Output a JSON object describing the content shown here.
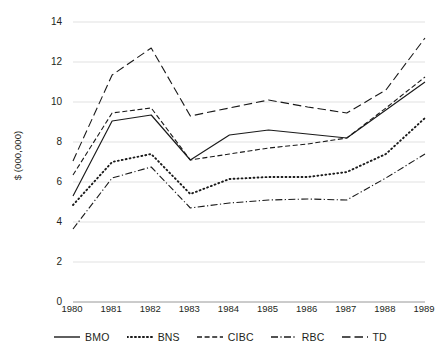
{
  "chart_data": {
    "type": "line",
    "title": "",
    "xlabel": "",
    "ylabel": "$ (000,000)",
    "categories": [
      "1980",
      "1981",
      "1982",
      "1983",
      "1984",
      "1985",
      "1986",
      "1987",
      "1988",
      "1989"
    ],
    "x": [
      1980,
      1981,
      1982,
      1983,
      1984,
      1985,
      1986,
      1987,
      1988,
      1989
    ],
    "ylim": [
      0,
      14
    ],
    "yticks": [
      0,
      2,
      4,
      6,
      8,
      10,
      12,
      14
    ],
    "ytick_labels": [
      "0",
      "2",
      "4",
      "6",
      "8",
      "10",
      "12",
      "14"
    ],
    "grid": true,
    "grid_axis": "y",
    "legend_position": "bottom",
    "series": [
      {
        "name": "BMO",
        "style": "solid",
        "color": "#1a1a1a",
        "values": [
          5.3,
          9.05,
          9.35,
          7.1,
          8.35,
          8.6,
          8.4,
          8.2,
          9.6,
          11.0
        ]
      },
      {
        "name": "BNS",
        "style": "dotted",
        "color": "#1a1a1a",
        "values": [
          4.85,
          7.0,
          7.4,
          5.4,
          6.15,
          6.25,
          6.25,
          6.5,
          7.4,
          9.2
        ]
      },
      {
        "name": "CIBC",
        "style": "dashed",
        "color": "#1a1a1a",
        "values": [
          6.35,
          9.45,
          9.7,
          7.1,
          7.4,
          7.7,
          7.9,
          8.2,
          9.7,
          11.25
        ]
      },
      {
        "name": "RBC",
        "style": "dashdot",
        "color": "#1a1a1a",
        "values": [
          3.65,
          6.2,
          6.75,
          4.7,
          4.95,
          5.1,
          5.15,
          5.1,
          6.2,
          7.4
        ]
      },
      {
        "name": "TD",
        "style": "longdash",
        "color": "#1a1a1a",
        "values": [
          7.05,
          11.35,
          12.7,
          9.3,
          9.7,
          10.1,
          9.75,
          9.45,
          10.6,
          13.2
        ]
      }
    ]
  },
  "legend": {
    "items": [
      {
        "label": "BMO",
        "style": "solid"
      },
      {
        "label": "BNS",
        "style": "dotted"
      },
      {
        "label": "CIBC",
        "style": "dashed"
      },
      {
        "label": "RBC",
        "style": "dashdot"
      },
      {
        "label": "TD",
        "style": "longdash"
      }
    ]
  },
  "colors": {
    "line": "#1a1a1a",
    "grid": "#d9d9d9",
    "axis": "#8c8c8c",
    "text": "#231f20",
    "background": "#ffffff"
  }
}
